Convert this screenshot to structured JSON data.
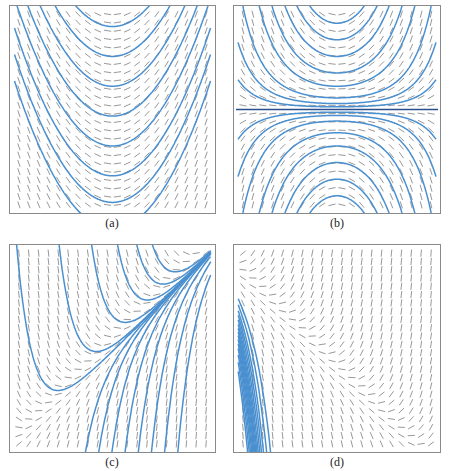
{
  "figure": {
    "colors": {
      "frame": "#8a8a8a",
      "slope_segment": "#6b6b6b",
      "solution_curve": "#4a90d0",
      "separatrix": "#2a4f8c"
    },
    "panels": [
      {
        "id": "a",
        "label": "(a)",
        "description": "slope field with upward-opening parabolic solution curves"
      },
      {
        "id": "b",
        "label": "(b)",
        "description": "slope field with horizontal equilibrium solution; curves open upward above and downward below"
      },
      {
        "id": "c",
        "label": "(c)",
        "description": "slope field with solution curves converging toward the upper-right corner"
      },
      {
        "id": "d",
        "label": "(d)",
        "description": "slope field with solution curves fanning out from the left edge and rising to the right"
      }
    ]
  },
  "chart_data": [
    {
      "type": "slope-field",
      "panel": "a",
      "title": "(a)",
      "curves": 9,
      "equilibrium": null
    },
    {
      "type": "slope-field",
      "panel": "b",
      "title": "(b)",
      "curves": 16,
      "equilibrium": "horizontal line at center"
    },
    {
      "type": "slope-field",
      "panel": "c",
      "title": "(c)",
      "curves": 14,
      "equilibrium": null
    },
    {
      "type": "slope-field",
      "panel": "d",
      "title": "(d)",
      "curves": 15,
      "equilibrium": null
    }
  ]
}
